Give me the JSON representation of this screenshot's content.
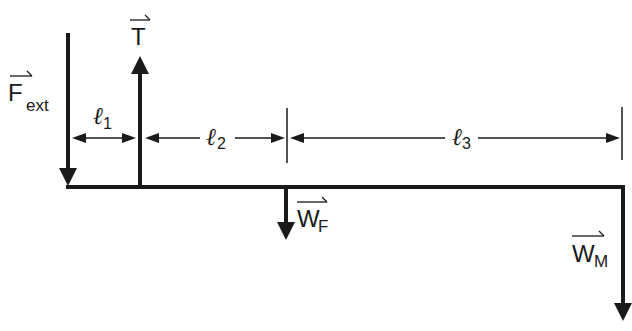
{
  "diagram": {
    "colors": {
      "ink": "#1a1a1a",
      "background": "#ffffff"
    },
    "forces": [
      {
        "id": "F_ext",
        "main": "F",
        "sub": "ext",
        "direction": "down"
      },
      {
        "id": "T",
        "main": "T",
        "sub": "",
        "direction": "up"
      },
      {
        "id": "W_F",
        "main": "W",
        "sub": "F",
        "direction": "down"
      },
      {
        "id": "W_M",
        "main": "W",
        "sub": "M",
        "direction": "down"
      }
    ],
    "distances": [
      {
        "id": "l1",
        "symbol": "ℓ",
        "sub": "1"
      },
      {
        "id": "l2",
        "symbol": "ℓ",
        "sub": "2"
      },
      {
        "id": "l3",
        "symbol": "ℓ",
        "sub": "3"
      }
    ]
  }
}
